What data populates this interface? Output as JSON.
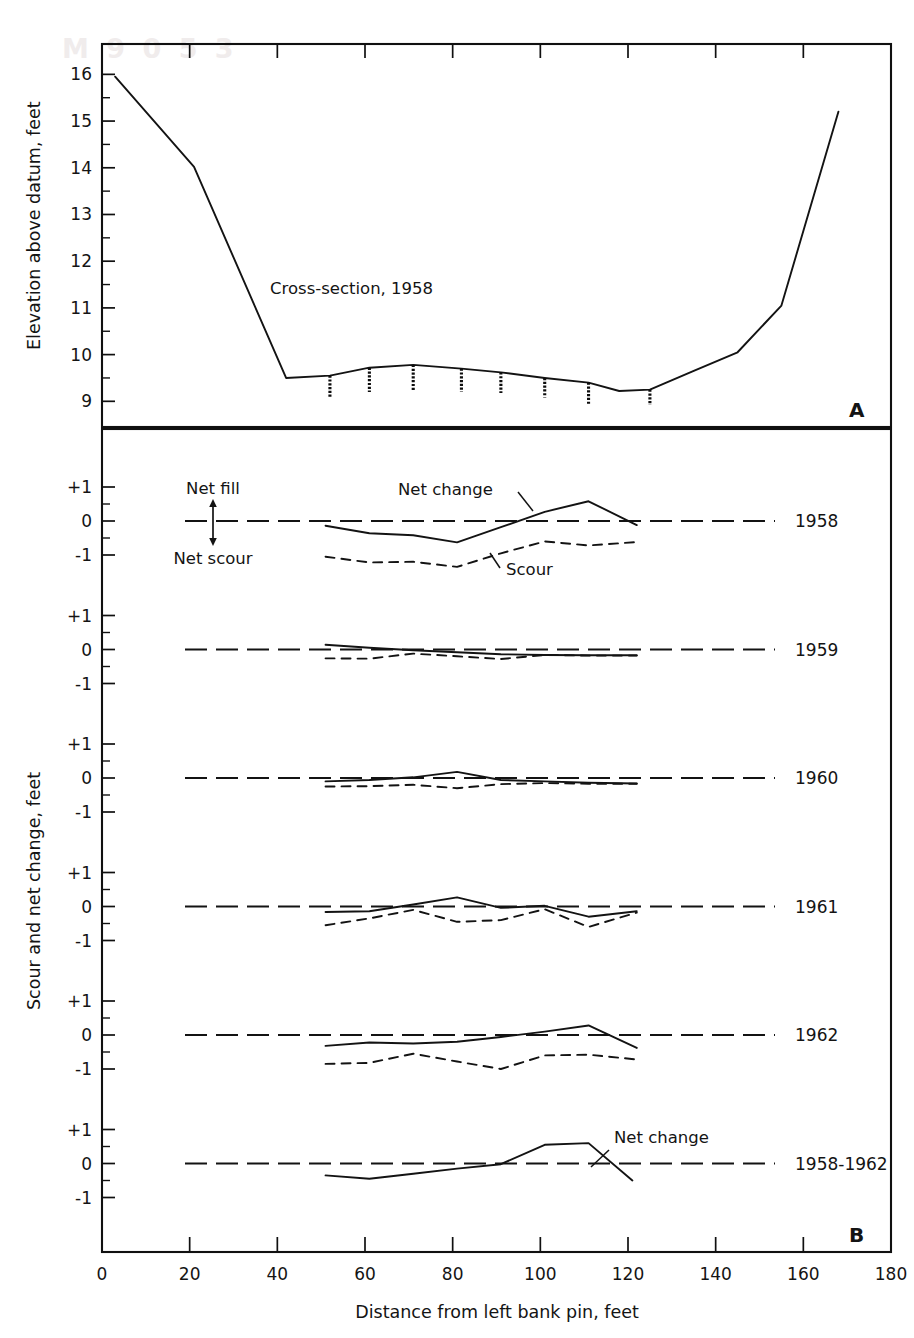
{
  "figure": {
    "watermark_text": "M 9 0  5 3",
    "panel_a_letter": "A",
    "panel_b_letter": "B"
  },
  "axes": {
    "x": {
      "title": "Distance from left bank pin, feet",
      "ticks": [
        0,
        20,
        40,
        60,
        80,
        100,
        120,
        140,
        160,
        180
      ],
      "tick_labels": [
        "0",
        "20",
        "40",
        "60",
        "80",
        "100",
        "120",
        "140",
        "160",
        "180"
      ],
      "min": 0,
      "max": 180
    },
    "panel_a_y": {
      "title": "Elevation above datum, feet",
      "ticks": [
        9,
        10,
        11,
        12,
        13,
        14,
        15,
        16
      ],
      "tick_labels": [
        "9",
        "10",
        "11",
        "12",
        "13",
        "14",
        "15",
        "16"
      ],
      "min": 8.45,
      "max": 16.65
    },
    "panel_b_y": {
      "title": "Scour and net change, feet",
      "tick_labels": [
        "+1",
        "0",
        "-1"
      ],
      "tick_values": [
        1,
        0,
        -1
      ],
      "min": -1.55,
      "max": 1.35
    }
  },
  "annotations": {
    "cross_section": "Cross-section, 1958",
    "net_fill": "Net fill",
    "net_scour": "Net scour",
    "net_change": "Net change",
    "scour": "Scour",
    "net_change_bottom": "Net change"
  },
  "chart_data": {
    "type": "line",
    "xlabel": "Distance from left bank pin, feet",
    "xlim": [
      0,
      180
    ],
    "grid": false,
    "panels": [
      {
        "id": "A",
        "ylabel": "Elevation above datum, feet",
        "ylim": [
          8.45,
          16.65
        ],
        "series": [
          {
            "name": "Cross-section, 1958",
            "style": "solid",
            "x": [
              3,
              21,
              42,
              52,
              61,
              71,
              82,
              91,
              101,
              111,
              118,
              125,
              135,
              145,
              155,
              168
            ],
            "y": [
              15.95,
              14.02,
              9.5,
              9.55,
              9.72,
              9.78,
              9.7,
              9.62,
              9.5,
              9.4,
              9.22,
              9.25,
              9.65,
              10.05,
              11.05,
              15.2
            ]
          }
        ],
        "scour_chains": [
          {
            "x": 52,
            "top": 9.55,
            "bottom": 9.1
          },
          {
            "x": 61,
            "top": 9.72,
            "bottom": 9.2
          },
          {
            "x": 71,
            "top": 9.78,
            "bottom": 9.22
          },
          {
            "x": 82,
            "top": 9.7,
            "bottom": 9.2
          },
          {
            "x": 91,
            "top": 9.62,
            "bottom": 9.18
          },
          {
            "x": 101,
            "top": 9.5,
            "bottom": 9.08
          },
          {
            "x": 111,
            "top": 9.4,
            "bottom": 8.95
          },
          {
            "x": 125,
            "top": 9.25,
            "bottom": 8.92
          }
        ]
      },
      {
        "id": "1958",
        "label": "1958",
        "ylim": [
          -1.55,
          1.35
        ],
        "series": [
          {
            "name": "Net change",
            "style": "solid",
            "x": [
              51,
              61,
              71,
              81,
              91,
              101,
              111,
              122
            ],
            "y": [
              -0.14,
              -0.36,
              -0.42,
              -0.63,
              -0.18,
              0.27,
              0.58,
              -0.12
            ]
          },
          {
            "name": "Scour",
            "style": "dashed",
            "x": [
              51,
              61,
              71,
              81,
              91,
              101,
              111,
              122
            ],
            "y": [
              -1.05,
              -1.22,
              -1.2,
              -1.35,
              -0.95,
              -0.6,
              -0.72,
              -0.62
            ]
          }
        ]
      },
      {
        "id": "1959",
        "label": "1959",
        "ylim": [
          -1.55,
          1.35
        ],
        "series": [
          {
            "name": "Net change",
            "style": "solid",
            "x": [
              51,
              61,
              71,
              81,
              91,
              101,
              111,
              122
            ],
            "y": [
              0.14,
              0.05,
              -0.02,
              -0.08,
              -0.14,
              -0.16,
              -0.17,
              -0.17
            ]
          },
          {
            "name": "Scour",
            "style": "dashed",
            "x": [
              51,
              61,
              71,
              81,
              91,
              101,
              111,
              122
            ],
            "y": [
              -0.26,
              -0.27,
              -0.12,
              -0.2,
              -0.28,
              -0.16,
              -0.18,
              -0.18
            ]
          }
        ]
      },
      {
        "id": "1960",
        "label": "1960",
        "ylim": [
          -1.55,
          1.35
        ],
        "series": [
          {
            "name": "Net change",
            "style": "solid",
            "x": [
              51,
              61,
              71,
              81,
              91,
              101,
              111,
              122
            ],
            "y": [
              -0.1,
              -0.06,
              0.02,
              0.18,
              -0.06,
              -0.1,
              -0.14,
              -0.16
            ]
          },
          {
            "name": "Scour",
            "style": "dashed",
            "x": [
              51,
              61,
              71,
              81,
              91,
              101,
              111,
              122
            ],
            "y": [
              -0.25,
              -0.24,
              -0.2,
              -0.3,
              -0.18,
              -0.15,
              -0.17,
              -0.17
            ]
          }
        ]
      },
      {
        "id": "1961",
        "label": "1961",
        "ylim": [
          -1.55,
          1.35
        ],
        "series": [
          {
            "name": "Net change",
            "style": "solid",
            "x": [
              51,
              61,
              71,
              81,
              91,
              101,
              111,
              122
            ],
            "y": [
              -0.16,
              -0.14,
              0.06,
              0.27,
              -0.04,
              0.02,
              -0.3,
              -0.14
            ]
          },
          {
            "name": "Scour",
            "style": "dashed",
            "x": [
              51,
              61,
              71,
              81,
              91,
              101,
              111,
              122
            ],
            "y": [
              -0.55,
              -0.35,
              -0.1,
              -0.45,
              -0.4,
              -0.08,
              -0.6,
              -0.18
            ]
          }
        ]
      },
      {
        "id": "1962",
        "label": "1962",
        "ylim": [
          -1.55,
          1.35
        ],
        "series": [
          {
            "name": "Net change",
            "style": "solid",
            "x": [
              51,
              61,
              71,
              81,
              91,
              101,
              111,
              122
            ],
            "y": [
              -0.32,
              -0.22,
              -0.25,
              -0.2,
              -0.06,
              0.1,
              0.28,
              -0.38
            ]
          },
          {
            "name": "Scour",
            "style": "dashed",
            "x": [
              51,
              61,
              71,
              81,
              91,
              101,
              111,
              122
            ],
            "y": [
              -0.85,
              -0.82,
              -0.55,
              -0.78,
              -1.0,
              -0.6,
              -0.58,
              -0.72
            ]
          }
        ]
      },
      {
        "id": "1958-1962",
        "label": "1958-1962",
        "ylim": [
          -1.55,
          1.35
        ],
        "series": [
          {
            "name": "Net change",
            "style": "solid",
            "x": [
              51,
              61,
              71,
              81,
              91,
              101,
              111,
              121
            ],
            "y": [
              -0.35,
              -0.45,
              -0.3,
              -0.15,
              -0.02,
              0.55,
              0.6,
              -0.5
            ]
          }
        ]
      }
    ]
  }
}
